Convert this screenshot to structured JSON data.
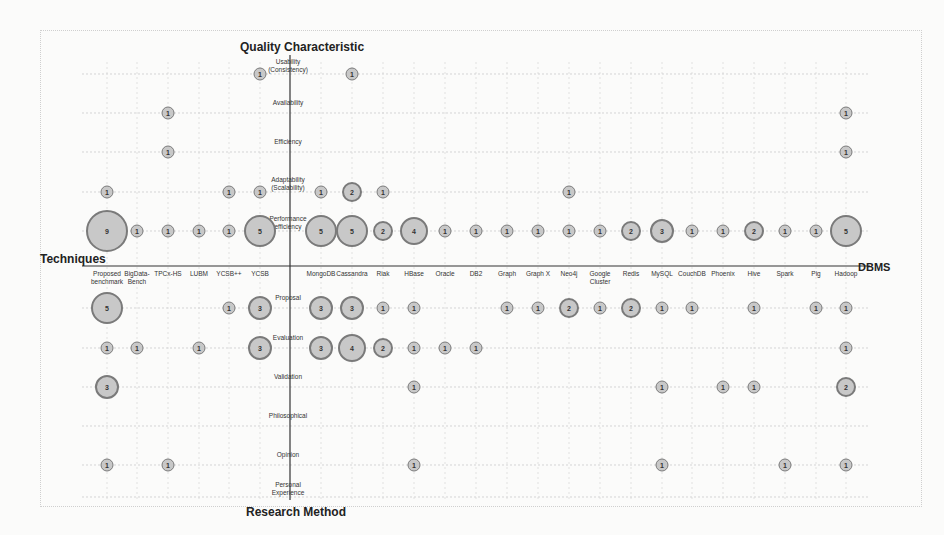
{
  "chart_data": {
    "type": "scatter",
    "subtype": "bubble-matrix",
    "title": "",
    "axis_titles": {
      "top": "Quality Characteristic",
      "bottom": "Research Method",
      "left": "Techniques",
      "right": "DBMS"
    },
    "columns": [
      {
        "name": "Proposed benchmark",
        "x": 107,
        "group": "Techniques"
      },
      {
        "name": "BigData-Bench",
        "x": 137,
        "group": "Techniques"
      },
      {
        "name": "TPCx-HS",
        "x": 168,
        "group": "Techniques"
      },
      {
        "name": "LUBM",
        "x": 199,
        "group": "Techniques"
      },
      {
        "name": "YCSB++",
        "x": 229,
        "group": "Techniques"
      },
      {
        "name": "YCSB",
        "x": 260,
        "group": "Techniques"
      },
      {
        "name": "MongoDB",
        "x": 321,
        "group": "DBMS"
      },
      {
        "name": "Cassandra",
        "x": 352,
        "group": "DBMS"
      },
      {
        "name": "Riak",
        "x": 383,
        "group": "DBMS"
      },
      {
        "name": "HBase",
        "x": 414,
        "group": "DBMS"
      },
      {
        "name": "Oracle",
        "x": 445,
        "group": "DBMS"
      },
      {
        "name": "DB2",
        "x": 476,
        "group": "DBMS"
      },
      {
        "name": "Graph",
        "x": 507,
        "group": "DBMS"
      },
      {
        "name": "Graph X",
        "x": 538,
        "group": "DBMS"
      },
      {
        "name": "Neo4j",
        "x": 569,
        "group": "DBMS"
      },
      {
        "name": "Google Cluster",
        "x": 600,
        "group": "DBMS"
      },
      {
        "name": "Redis",
        "x": 631,
        "group": "DBMS"
      },
      {
        "name": "MySQL",
        "x": 662,
        "group": "DBMS"
      },
      {
        "name": "CouchDB",
        "x": 692,
        "group": "DBMS"
      },
      {
        "name": "Phoenix",
        "x": 723,
        "group": "DBMS"
      },
      {
        "name": "Hive",
        "x": 754,
        "group": "DBMS"
      },
      {
        "name": "Spark",
        "x": 785,
        "group": "DBMS"
      },
      {
        "name": "Pig",
        "x": 816,
        "group": "DBMS"
      },
      {
        "name": "Hadoop",
        "x": 846,
        "group": "DBMS"
      }
    ],
    "rows": [
      {
        "name": "Usability (Consistency)",
        "y": 74,
        "group": "Quality Characteristic"
      },
      {
        "name": "Availability",
        "y": 113,
        "group": "Quality Characteristic"
      },
      {
        "name": "Efficiency",
        "y": 152,
        "group": "Quality Characteristic"
      },
      {
        "name": "Adaptability (Scalability)",
        "y": 192,
        "group": "Quality Characteristic"
      },
      {
        "name": "Performance efficiency",
        "y": 231,
        "group": "Quality Characteristic"
      },
      {
        "name": "Proposal",
        "y": 308,
        "group": "Research Method"
      },
      {
        "name": "Evaluation",
        "y": 348,
        "group": "Research Method"
      },
      {
        "name": "Validation",
        "y": 387,
        "group": "Research Method"
      },
      {
        "name": "Philosophical",
        "y": 426,
        "group": "Research Method"
      },
      {
        "name": "Opinion",
        "y": 465,
        "group": "Research Method"
      },
      {
        "name": "Personal Experience",
        "y": 497,
        "group": "Research Method"
      }
    ],
    "points": [
      {
        "row": "Usability (Consistency)",
        "col": "YCSB",
        "value": 1
      },
      {
        "row": "Usability (Consistency)",
        "col": "Cassandra",
        "value": 1
      },
      {
        "row": "Availability",
        "col": "TPCx-HS",
        "value": 1
      },
      {
        "row": "Availability",
        "col": "Hadoop",
        "value": 1
      },
      {
        "row": "Efficiency",
        "col": "TPCx-HS",
        "value": 1
      },
      {
        "row": "Efficiency",
        "col": "Hadoop",
        "value": 1
      },
      {
        "row": "Adaptability (Scalability)",
        "col": "Proposed benchmark",
        "value": 1
      },
      {
        "row": "Adaptability (Scalability)",
        "col": "YCSB++",
        "value": 1
      },
      {
        "row": "Adaptability (Scalability)",
        "col": "YCSB",
        "value": 1
      },
      {
        "row": "Adaptability (Scalability)",
        "col": "MongoDB",
        "value": 1
      },
      {
        "row": "Adaptability (Scalability)",
        "col": "Cassandra",
        "value": 2
      },
      {
        "row": "Adaptability (Scalability)",
        "col": "Riak",
        "value": 1
      },
      {
        "row": "Adaptability (Scalability)",
        "col": "Neo4j",
        "value": 1
      },
      {
        "row": "Performance efficiency",
        "col": "Proposed benchmark",
        "value": 9
      },
      {
        "row": "Performance efficiency",
        "col": "BigData-Bench",
        "value": 1
      },
      {
        "row": "Performance efficiency",
        "col": "TPCx-HS",
        "value": 1
      },
      {
        "row": "Performance efficiency",
        "col": "LUBM",
        "value": 1
      },
      {
        "row": "Performance efficiency",
        "col": "YCSB++",
        "value": 1
      },
      {
        "row": "Performance efficiency",
        "col": "YCSB",
        "value": 5
      },
      {
        "row": "Performance efficiency",
        "col": "MongoDB",
        "value": 5
      },
      {
        "row": "Performance efficiency",
        "col": "Cassandra",
        "value": 5
      },
      {
        "row": "Performance efficiency",
        "col": "Riak",
        "value": 2
      },
      {
        "row": "Performance efficiency",
        "col": "HBase",
        "value": 4
      },
      {
        "row": "Performance efficiency",
        "col": "Oracle",
        "value": 1
      },
      {
        "row": "Performance efficiency",
        "col": "DB2",
        "value": 1
      },
      {
        "row": "Performance efficiency",
        "col": "Graph",
        "value": 1
      },
      {
        "row": "Performance efficiency",
        "col": "Graph X",
        "value": 1
      },
      {
        "row": "Performance efficiency",
        "col": "Neo4j",
        "value": 1
      },
      {
        "row": "Performance efficiency",
        "col": "Google Cluster",
        "value": 1
      },
      {
        "row": "Performance efficiency",
        "col": "Redis",
        "value": 2
      },
      {
        "row": "Performance efficiency",
        "col": "MySQL",
        "value": 3
      },
      {
        "row": "Performance efficiency",
        "col": "CouchDB",
        "value": 1
      },
      {
        "row": "Performance efficiency",
        "col": "Phoenix",
        "value": 1
      },
      {
        "row": "Performance efficiency",
        "col": "Hive",
        "value": 2
      },
      {
        "row": "Performance efficiency",
        "col": "Spark",
        "value": 1
      },
      {
        "row": "Performance efficiency",
        "col": "Pig",
        "value": 1
      },
      {
        "row": "Performance efficiency",
        "col": "Hadoop",
        "value": 5
      },
      {
        "row": "Proposal",
        "col": "Proposed benchmark",
        "value": 5
      },
      {
        "row": "Proposal",
        "col": "YCSB++",
        "value": 1
      },
      {
        "row": "Proposal",
        "col": "YCSB",
        "value": 3
      },
      {
        "row": "Proposal",
        "col": "MongoDB",
        "value": 3
      },
      {
        "row": "Proposal",
        "col": "Cassandra",
        "value": 3
      },
      {
        "row": "Proposal",
        "col": "Riak",
        "value": 1
      },
      {
        "row": "Proposal",
        "col": "HBase",
        "value": 1
      },
      {
        "row": "Proposal",
        "col": "Graph",
        "value": 1
      },
      {
        "row": "Proposal",
        "col": "Graph X",
        "value": 1
      },
      {
        "row": "Proposal",
        "col": "Neo4j",
        "value": 2
      },
      {
        "row": "Proposal",
        "col": "Google Cluster",
        "value": 1
      },
      {
        "row": "Proposal",
        "col": "Redis",
        "value": 2
      },
      {
        "row": "Proposal",
        "col": "MySQL",
        "value": 1
      },
      {
        "row": "Proposal",
        "col": "CouchDB",
        "value": 1
      },
      {
        "row": "Proposal",
        "col": "Hive",
        "value": 1
      },
      {
        "row": "Proposal",
        "col": "Pig",
        "value": 1
      },
      {
        "row": "Proposal",
        "col": "Hadoop",
        "value": 1
      },
      {
        "row": "Evaluation",
        "col": "Proposed benchmark",
        "value": 1
      },
      {
        "row": "Evaluation",
        "col": "BigData-Bench",
        "value": 1
      },
      {
        "row": "Evaluation",
        "col": "LUBM",
        "value": 1
      },
      {
        "row": "Evaluation",
        "col": "YCSB",
        "value": 3
      },
      {
        "row": "Evaluation",
        "col": "MongoDB",
        "value": 3
      },
      {
        "row": "Evaluation",
        "col": "Cassandra",
        "value": 4
      },
      {
        "row": "Evaluation",
        "col": "Riak",
        "value": 2
      },
      {
        "row": "Evaluation",
        "col": "HBase",
        "value": 1
      },
      {
        "row": "Evaluation",
        "col": "Oracle",
        "value": 1
      },
      {
        "row": "Evaluation",
        "col": "DB2",
        "value": 1
      },
      {
        "row": "Evaluation",
        "col": "Hadoop",
        "value": 1
      },
      {
        "row": "Validation",
        "col": "Proposed benchmark",
        "value": 3
      },
      {
        "row": "Validation",
        "col": "HBase",
        "value": 1
      },
      {
        "row": "Validation",
        "col": "MySQL",
        "value": 1
      },
      {
        "row": "Validation",
        "col": "Phoenix",
        "value": 1
      },
      {
        "row": "Validation",
        "col": "Hive",
        "value": 1
      },
      {
        "row": "Validation",
        "col": "Hadoop",
        "value": 2
      },
      {
        "row": "Opinion",
        "col": "Proposed benchmark",
        "value": 1
      },
      {
        "row": "Opinion",
        "col": "TPCx-HS",
        "value": 1
      },
      {
        "row": "Opinion",
        "col": "HBase",
        "value": 1
      },
      {
        "row": "Opinion",
        "col": "MySQL",
        "value": 1
      },
      {
        "row": "Opinion",
        "col": "Spark",
        "value": 1
      },
      {
        "row": "Opinion",
        "col": "Hadoop",
        "value": 1
      }
    ],
    "layout": {
      "grid": true,
      "grid_style": "dotted",
      "x_axis_y": 266,
      "y_axis_x": 290,
      "bubble_fill": "#c8c8c8",
      "bubble_stroke": "#7a7a7a",
      "bubble_size_scale": {
        "1": 13,
        "2": 20,
        "3": 24,
        "4": 28,
        "5": 32,
        "9": 42
      }
    }
  }
}
